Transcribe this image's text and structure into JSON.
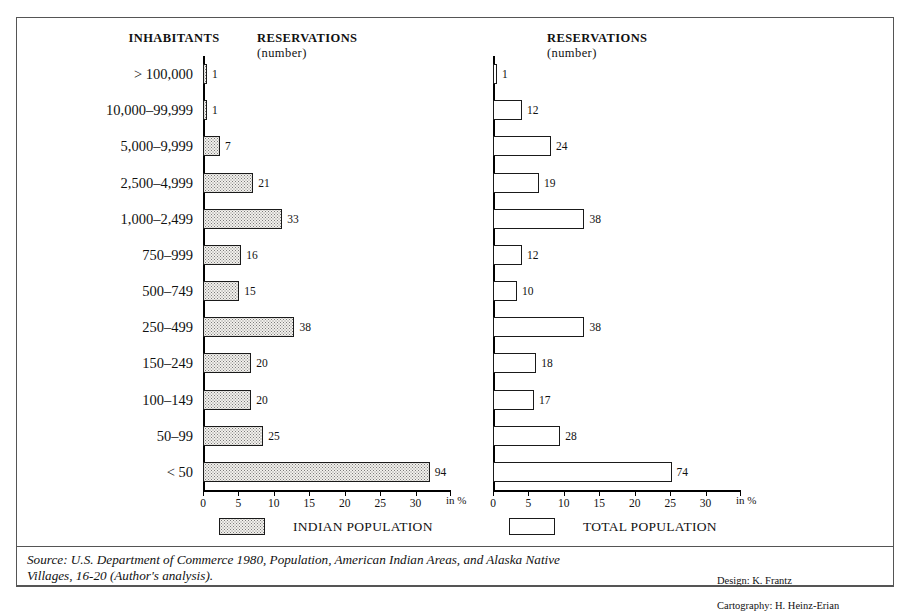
{
  "headers": {
    "inhabitants": "INHABITANTS",
    "left_title_line1": "RESERVATIONS",
    "left_title_line2": "(number)",
    "right_title_line1": "RESERVATIONS",
    "right_title_line2": "(number)"
  },
  "axis": {
    "unit_label": "in %",
    "ticks": [
      "0",
      "5",
      "10",
      "15",
      "20",
      "25",
      "30"
    ]
  },
  "legend": {
    "left_label": "INDIAN POPULATION",
    "right_label": "TOTAL POPULATION"
  },
  "footer": {
    "source": "Source: U.S. Department of Commerce 1980, Population, American Indian Areas, and Alaska Native\nVillages, 16-20 (Author's analysis).",
    "design": "Design: K. Frantz",
    "cartography": "Cartography: H. Heinz-Erian"
  },
  "chart_data": {
    "type": "bar",
    "orientation": "horizontal",
    "xlabel": "in %",
    "ylabel": "INHABITANTS",
    "xlim": [
      0,
      35
    ],
    "xticks": [
      0,
      5,
      10,
      15,
      20,
      25,
      30
    ],
    "grid": false,
    "legend_position": "below",
    "categories": [
      "> 100,000",
      "10,000–99,999",
      "5,000–9,999",
      "2,500–4,999",
      "1,000–2,499",
      "750–999",
      "500–749",
      "250–499",
      "150–249",
      "100–149",
      "50–99",
      "< 50"
    ],
    "series": [
      {
        "name": "INDIAN POPULATION",
        "unit": "number of reservations",
        "fill": "stippled",
        "values": [
          1,
          1,
          7,
          21,
          33,
          16,
          15,
          38,
          20,
          20,
          25,
          94
        ],
        "percent": [
          0.3,
          0.3,
          2.4,
          7.1,
          11.2,
          5.4,
          5.1,
          12.9,
          6.8,
          6.8,
          8.5,
          32.0
        ]
      },
      {
        "name": "TOTAL POPULATION",
        "unit": "number of reservations",
        "fill": "hollow",
        "values": [
          1,
          12,
          24,
          19,
          38,
          12,
          10,
          38,
          18,
          17,
          28,
          74
        ],
        "percent": [
          0.3,
          4.1,
          8.2,
          6.5,
          12.9,
          4.1,
          3.4,
          12.9,
          6.1,
          5.8,
          9.5,
          25.2
        ]
      }
    ]
  }
}
